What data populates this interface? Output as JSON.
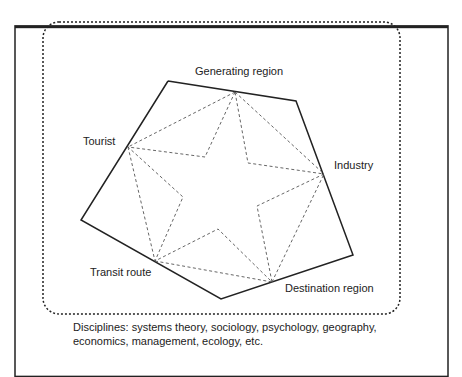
{
  "labels": {
    "generating": "Generating region",
    "tourist": "Tourist",
    "industry": "Industry",
    "transit": "Transit route",
    "destination": "Destination region"
  },
  "caption": {
    "line1": "Disciplines: systems theory, sociology, psychology, geography,",
    "line2": "economics, management, ecology, etc."
  },
  "colors": {
    "line": "#222222",
    "dash": "#666666",
    "background": "#ffffff"
  }
}
